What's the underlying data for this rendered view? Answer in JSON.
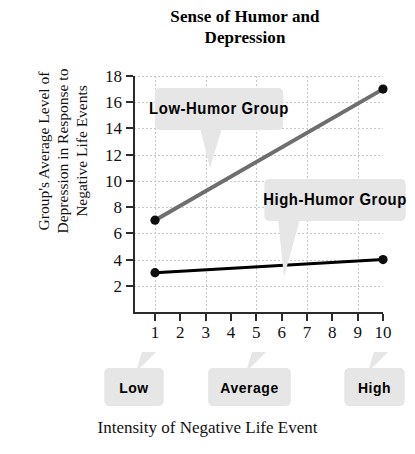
{
  "chart_data": {
    "type": "line",
    "title": "Sense of Humor and Depression",
    "title_lines": [
      "Sense of Humor and",
      "Depression"
    ],
    "xlabel": "Intensity of Negative Life Event",
    "ylabel": "Group's Average Level of Depression in Response to Negative Life Events",
    "ylabel_lines": [
      "Group's Average Level of",
      "Depression in Response to",
      "Negative Life Events"
    ],
    "x": [
      1,
      2,
      3,
      4,
      5,
      6,
      7,
      8,
      9,
      10
    ],
    "xticks": [
      "1",
      "2",
      "3",
      "4",
      "5",
      "6",
      "7",
      "8",
      "9",
      "10"
    ],
    "yticks": [
      "18",
      "16",
      "14",
      "12",
      "10",
      "8",
      "6",
      "4",
      "2"
    ],
    "ytick_values": [
      18,
      16,
      14,
      12,
      10,
      8,
      6,
      4,
      2
    ],
    "xlim": [
      1,
      10
    ],
    "ylim": [
      0,
      18
    ],
    "grid": true,
    "legend": "annotations",
    "series": [
      {
        "name": "Low-Humor Group",
        "color": "#6e6e6e",
        "linewidth": 4,
        "points": [
          {
            "x": 1,
            "y": 7
          },
          {
            "x": 10,
            "y": 17
          }
        ],
        "markers": [
          {
            "x": 1,
            "y": 7
          },
          {
            "x": 10,
            "y": 17
          }
        ]
      },
      {
        "name": "High-Humor Group",
        "color": "#000000",
        "linewidth": 3,
        "points": [
          {
            "x": 1,
            "y": 3
          },
          {
            "x": 10,
            "y": 4
          }
        ],
        "markers": [
          {
            "x": 1,
            "y": 3
          },
          {
            "x": 10,
            "y": 4
          }
        ]
      }
    ],
    "annotations": [
      {
        "id": "low-humor",
        "label": "Low-Humor Group"
      },
      {
        "id": "high-humor",
        "label": "High-Humor Group"
      },
      {
        "id": "low",
        "label": "Low"
      },
      {
        "id": "average",
        "label": "Average"
      },
      {
        "id": "high",
        "label": "High"
      }
    ],
    "colors": {
      "low_humor_line": "#6e6e6e",
      "high_humor_line": "#000000",
      "callout_background": "#e6e6e6",
      "axis": "#2b2b2b",
      "gridline": "#c9c9c9",
      "background": "#ffffff"
    }
  }
}
